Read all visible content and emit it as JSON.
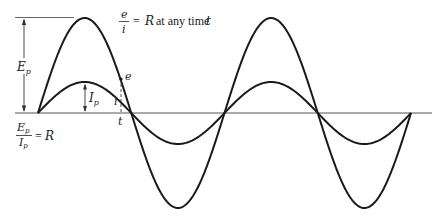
{
  "figure": {
    "axis": {
      "y": 113,
      "x_start": 15,
      "x_end": 432,
      "color": "#555555"
    },
    "curves": [
      {
        "name": "voltage-e",
        "label": "e",
        "amplitude_px": 95,
        "peak_label": "E",
        "peak_sub": "p"
      },
      {
        "name": "current-i",
        "label": "i",
        "amplitude_px": 31,
        "peak_label": "I",
        "peak_sub": "p"
      }
    ],
    "wave": {
      "x_start": 38,
      "x_end": 411,
      "cycles": 2,
      "stroke": "#1a1a1a"
    },
    "annotations": {
      "top_formula": {
        "num": "e",
        "den": "i",
        "rest_eq": "=",
        "rest_R": "R",
        "rest_text": " at any time ",
        "rest_t": "t"
      },
      "bottom_formula": {
        "num_main": "E",
        "num_sub": "p",
        "den_main": "I",
        "den_sub": "p",
        "eq": "=",
        "R": "R"
      },
      "ep_dim": {
        "main": "E",
        "sub": "p"
      },
      "ip_dim": {
        "main": "I",
        "sub": "p"
      },
      "instant": {
        "e_label": "e",
        "i_label": "i",
        "t_label": "t"
      }
    }
  }
}
